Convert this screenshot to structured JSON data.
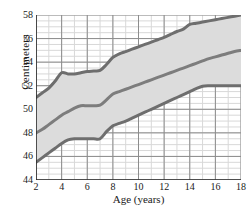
{
  "chart_data": {
    "type": "line",
    "title": "",
    "xlabel": "Age (years)",
    "ylabel": "Centimeters",
    "xlim": [
      2,
      18
    ],
    "ylim": [
      44,
      58
    ],
    "xticks": [
      2,
      4,
      6,
      8,
      10,
      12,
      14,
      16,
      18
    ],
    "yticks": [
      44,
      46,
      48,
      50,
      52,
      54,
      56,
      58
    ],
    "grid": true,
    "grid_major_color": "#8c8c8c",
    "grid_minor_color": "#d8d8d8",
    "minor_x_step": 1,
    "minor_y_step": 0.5,
    "legend": "none",
    "band_fill_color": "#dcdcdc",
    "band_between": [
      "upper",
      "lower"
    ],
    "line_color": "#6e6e6e",
    "line_width": 3,
    "series": [
      {
        "name": "upper",
        "color": "#6e6e6e",
        "x": [
          2,
          2.5,
          3,
          3.5,
          4,
          4.5,
          5,
          5.5,
          6,
          6.5,
          7,
          7.5,
          8,
          8.5,
          9,
          9.5,
          10,
          10.5,
          11,
          11.5,
          12,
          12.5,
          13,
          13.5,
          14,
          14.5,
          15,
          15.5,
          16,
          16.5,
          17,
          17.5,
          18
        ],
        "y": [
          51.0,
          51.4,
          51.8,
          52.4,
          53.1,
          53.0,
          53.0,
          53.1,
          53.2,
          53.25,
          53.3,
          53.8,
          54.4,
          54.7,
          54.9,
          55.1,
          55.3,
          55.5,
          55.7,
          55.9,
          56.1,
          56.35,
          56.6,
          56.8,
          57.2,
          57.3,
          57.4,
          57.5,
          57.6,
          57.7,
          57.8,
          57.9,
          58.0
        ]
      },
      {
        "name": "middle",
        "color": "#7d7d7d",
        "x": [
          2,
          2.5,
          3,
          3.5,
          4,
          4.5,
          5,
          5.5,
          6,
          6.5,
          7,
          7.5,
          8,
          8.5,
          9,
          9.5,
          10,
          10.5,
          11,
          11.5,
          12,
          12.5,
          13,
          13.5,
          14,
          14.5,
          15,
          15.5,
          16,
          16.5,
          17,
          17.5,
          18
        ],
        "y": [
          48.0,
          48.3,
          48.7,
          49.1,
          49.5,
          49.8,
          50.1,
          50.3,
          50.3,
          50.3,
          50.35,
          50.8,
          51.3,
          51.5,
          51.7,
          51.9,
          52.1,
          52.3,
          52.5,
          52.7,
          52.9,
          53.1,
          53.3,
          53.5,
          53.7,
          53.9,
          54.1,
          54.3,
          54.45,
          54.6,
          54.75,
          54.9,
          55.0
        ]
      },
      {
        "name": "lower",
        "color": "#6e6e6e",
        "x": [
          2,
          2.5,
          3,
          3.5,
          4,
          4.5,
          5,
          5.5,
          6,
          6.5,
          7,
          7.5,
          8,
          8.5,
          9,
          9.5,
          10,
          10.5,
          11,
          11.5,
          12,
          12.5,
          13,
          13.5,
          14,
          14.5,
          15,
          15.5,
          16,
          16.5,
          17,
          17.5,
          18
        ],
        "y": [
          45.5,
          45.9,
          46.3,
          46.7,
          47.1,
          47.4,
          47.5,
          47.5,
          47.5,
          47.5,
          47.5,
          48.1,
          48.6,
          48.8,
          49.0,
          49.25,
          49.5,
          49.75,
          50.0,
          50.25,
          50.5,
          50.75,
          51.0,
          51.25,
          51.5,
          51.75,
          51.95,
          52.0,
          52.0,
          52.0,
          52.0,
          52.0,
          52.0
        ]
      }
    ]
  }
}
